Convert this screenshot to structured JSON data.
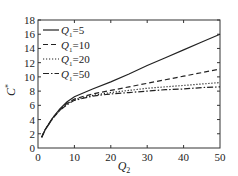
{
  "chart_data": {
    "type": "line",
    "title": "",
    "xlabel": "Q2",
    "ylabel": "C",
    "xlim": [
      0,
      50
    ],
    "ylim": [
      0,
      18
    ],
    "xticks": [
      0,
      10,
      20,
      30,
      40,
      50
    ],
    "yticks": [
      0,
      2,
      4,
      6,
      8,
      10,
      12,
      14,
      16,
      18
    ],
    "grid": false,
    "legend_position": "upper left",
    "x": [
      1,
      2,
      4,
      6,
      8,
      10,
      15,
      20,
      25,
      30,
      35,
      40,
      45,
      50
    ],
    "series": [
      {
        "name": "Q1=5",
        "style": "solid",
        "values": [
          1.5,
          2.6,
          4.2,
          5.5,
          6.5,
          7.2,
          8.3,
          9.3,
          10.4,
          11.6,
          12.7,
          13.8,
          14.9,
          16.0
        ]
      },
      {
        "name": "Q1=10",
        "style": "dashed",
        "values": [
          1.5,
          2.6,
          4.2,
          5.4,
          6.3,
          6.9,
          7.6,
          8.1,
          8.6,
          9.1,
          9.6,
          10.1,
          10.6,
          11.1
        ]
      },
      {
        "name": "Q1=20",
        "style": "dotted",
        "values": [
          1.5,
          2.6,
          4.2,
          5.3,
          6.2,
          6.8,
          7.4,
          7.8,
          8.1,
          8.4,
          8.6,
          8.8,
          9.0,
          9.2
        ]
      },
      {
        "name": "Q1=50",
        "style": "dashdot",
        "values": [
          1.5,
          2.6,
          4.1,
          5.3,
          6.1,
          6.7,
          7.3,
          7.6,
          7.8,
          8.0,
          8.2,
          8.3,
          8.5,
          8.6
        ]
      }
    ]
  },
  "axes": {
    "xlabel_main": "Q",
    "xlabel_sub": "2",
    "ylabel_main": "C",
    "ylabel_sup": "*"
  },
  "legend": [
    {
      "label_main": "Q",
      "label_sub": "1",
      "label_val": "=5"
    },
    {
      "label_main": "Q",
      "label_sub": "1",
      "label_val": "=10"
    },
    {
      "label_main": "Q",
      "label_sub": "1",
      "label_val": "=20"
    },
    {
      "label_main": "Q",
      "label_sub": "1",
      "label_val": "=50"
    }
  ]
}
